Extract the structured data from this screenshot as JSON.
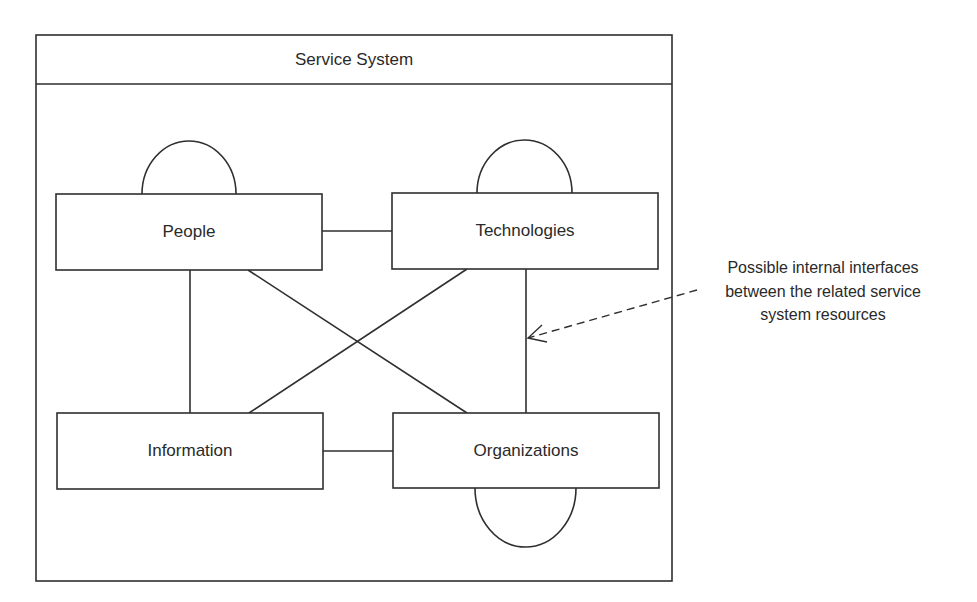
{
  "diagram": {
    "title": "Service System",
    "colors": {
      "stroke": "#2f2f2f",
      "background": "#ffffff",
      "text": "#2a2a2a"
    },
    "nodes": [
      {
        "id": "people",
        "label": "People",
        "self_interface": "top"
      },
      {
        "id": "technologies",
        "label": "Technologies",
        "self_interface": "top"
      },
      {
        "id": "information",
        "label": "Information",
        "self_interface": "none"
      },
      {
        "id": "organizations",
        "label": "Organizations",
        "self_interface": "bottom"
      }
    ],
    "edges": [
      {
        "from": "people",
        "to": "technologies"
      },
      {
        "from": "people",
        "to": "information"
      },
      {
        "from": "people",
        "to": "organizations"
      },
      {
        "from": "technologies",
        "to": "information"
      },
      {
        "from": "technologies",
        "to": "organizations"
      },
      {
        "from": "information",
        "to": "organizations"
      }
    ],
    "annotation": {
      "lines": [
        "Possible internal interfaces",
        "between the related service",
        "system resources"
      ],
      "arrow_style": "dashed",
      "points_to": "technologies-organizations interface"
    }
  }
}
